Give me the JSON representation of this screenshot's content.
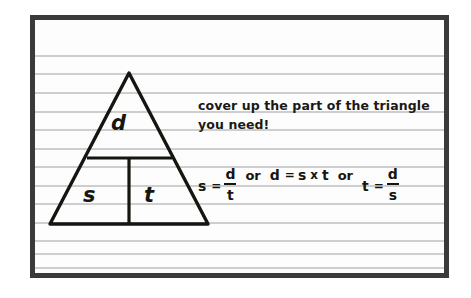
{
  "page": {
    "kind": "handwritten-notebook-page",
    "paper_color": "#fdfdfd",
    "rule_color": "#c6c6c6",
    "border_color": "#3b3a38",
    "ink_color": "#16150f",
    "rule_count": 13
  },
  "triangle": {
    "name": "speed-distance-time-triangle",
    "top_label": "d",
    "bottom_left_label": "s",
    "bottom_right_label": "t"
  },
  "notes": {
    "instruction_line_1": "cover up the part of the triangle",
    "instruction_line_2": "you need!"
  },
  "formulas": {
    "conjunction": "or",
    "times_symbol": "x",
    "equals_symbol": "=",
    "items": [
      {
        "lhs": "s",
        "numerator": "d",
        "denominator": "t",
        "type": "fraction"
      },
      {
        "lhs": "d",
        "factor_1": "s",
        "factor_2": "t",
        "type": "product"
      },
      {
        "lhs": "t",
        "numerator": "d",
        "denominator": "s",
        "type": "fraction"
      }
    ]
  }
}
